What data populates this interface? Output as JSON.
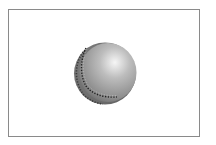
{
  "image": {
    "subject": "grey seamed ball",
    "background": "#ffffff",
    "frame_border_color": "#8a8a8a"
  },
  "ball": {
    "base_color": "#9a9a9a",
    "highlight_color": "#f4f4f4",
    "shadow_color": "#5a5a5a",
    "seam_color": "#2a2a2a",
    "seam-icon": "dashed-seam-icon"
  }
}
